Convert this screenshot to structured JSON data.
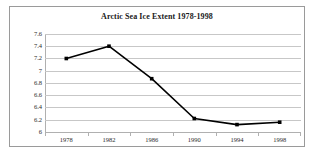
{
  "chart_data": {
    "type": "line",
    "title": "Arctic Sea Ice Extent 1978-1998",
    "xlabel": "",
    "ylabel": "",
    "categories": [
      "1978",
      "1982",
      "1986",
      "1990",
      "1994",
      "1998"
    ],
    "x": [
      1978,
      1982,
      1986,
      1990,
      1994,
      1998
    ],
    "values": [
      7.2,
      7.4,
      6.87,
      6.22,
      6.12,
      6.16
    ],
    "series": [
      {
        "name": "Arctic Sea Ice Extent",
        "values": [
          7.2,
          7.4,
          6.87,
          6.22,
          6.12,
          6.16
        ]
      }
    ],
    "ylim": [
      6,
      7.6
    ],
    "xlim": [
      1978,
      1998
    ],
    "ytick_labels": [
      "7.6",
      "7.4",
      "7.2",
      "7",
      "6.8",
      "6.6",
      "6.4",
      "6.2",
      "6"
    ],
    "ytick_values": [
      7.6,
      7.4,
      7.2,
      7.0,
      6.8,
      6.6,
      6.4,
      6.2,
      6.0
    ],
    "xtick_labels": [
      "1978",
      "1982",
      "1986",
      "1990",
      "1994",
      "1998"
    ],
    "grid": true,
    "grid_axis": "y",
    "legend": false,
    "legend_position": "none",
    "line_color": "#000000",
    "marker": "square",
    "marker_color": "#000000",
    "grid_color": "#c7c7c7",
    "plot_background": "#ffffff",
    "border_color": "#9a9a9a"
  }
}
